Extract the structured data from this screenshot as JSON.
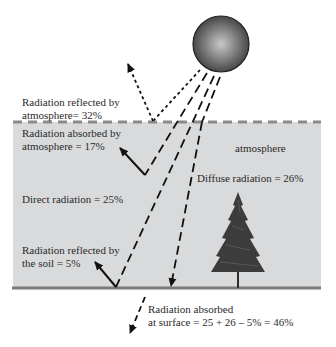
{
  "diagram": {
    "colors": {
      "atmosphere_fill": "#d9dadb",
      "ground_line": "#7a7a7a",
      "boundary_dash": "#8a8a8a",
      "arrows": "#111111",
      "sun_dark": "#3a3a3a",
      "sun_light": "#bdbdbd",
      "tree": "#3c3c3c"
    },
    "elements": {
      "sun": "sun",
      "tree": "tree",
      "atmosphere_region": "atmosphere",
      "ground": "surface"
    },
    "labels": {
      "reflected_atmosphere_line1": "Radiation reflected by",
      "reflected_atmosphere_line2": "atmosphere= 32%",
      "absorbed_atmosphere_line1": "Radiation absorbed by",
      "absorbed_atmosphere_line2": "atmosphere = 17%",
      "atmosphere": "atmosphere",
      "diffuse": "Diffuse radiation  = 26%",
      "direct": "Direct radiation = 25%",
      "reflected_soil_line1": "Radiation reflected by",
      "reflected_soil_line2": "the soil = 5%",
      "absorbed_surface_line1": "Radiation absorbed",
      "absorbed_surface_line2": "at surface = 25 + 26 – 5% = 46%"
    },
    "values": {
      "reflected_by_atmosphere_pct": 32,
      "absorbed_by_atmosphere_pct": 17,
      "diffuse_radiation_pct": 26,
      "direct_radiation_pct": 25,
      "reflected_by_soil_pct": 5,
      "absorbed_at_surface_pct": 46
    }
  }
}
